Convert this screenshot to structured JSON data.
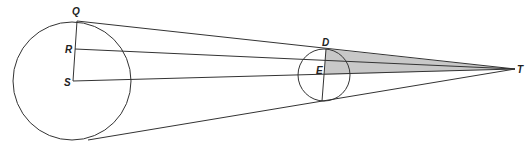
{
  "diagram": {
    "title": "",
    "colors": {
      "stroke": "#333333",
      "shade": "#c8c8c8",
      "background": "#ffffff"
    },
    "large_circle": {
      "cx": 72,
      "cy": 81,
      "r": 59
    },
    "small_circle": {
      "cx": 324,
      "cy": 75,
      "r": 26
    },
    "points": {
      "Q": {
        "label": "Q",
        "x": 77,
        "y": 21
      },
      "R": {
        "label": "R",
        "x": 75,
        "y": 49
      },
      "S": {
        "label": "S",
        "x": 73,
        "y": 81
      },
      "D": {
        "label": "D",
        "x": 326,
        "y": 49
      },
      "E": {
        "label": "E",
        "x": 324,
        "y": 75
      },
      "T": {
        "label": "T",
        "x": 515,
        "y": 69
      }
    },
    "labels": {
      "Q": "Q",
      "R": "R",
      "S": "S",
      "D": "D",
      "E": "E",
      "T": "T"
    },
    "shaded_region": "triangle D-E-T"
  }
}
